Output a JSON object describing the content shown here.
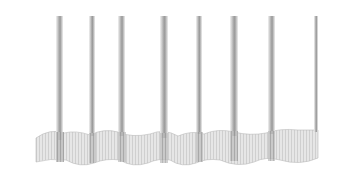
{
  "image": {
    "subject": "curtain drapery folds illustration",
    "background": "#ffffff",
    "fold_color_dark": "#9a9a9a",
    "fold_color_light": "#d8d8d8",
    "hem_color": "#e2e2e2",
    "fold_count": 8
  }
}
